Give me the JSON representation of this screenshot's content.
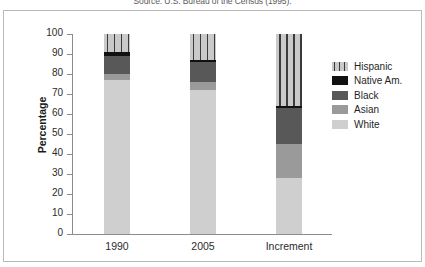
{
  "caption": "Source: U.S. Bureau of the Census (1995).",
  "axes": {
    "ylabel": "Percentage",
    "yticks": [
      "0",
      "10",
      "20",
      "30",
      "40",
      "50",
      "60",
      "70",
      "80",
      "90",
      "100"
    ]
  },
  "legend": {
    "items": [
      {
        "label": "Hispanic",
        "key": "hispanic",
        "color": "#c9c9c9"
      },
      {
        "label": "Native Am.",
        "key": "native",
        "color": "#111111"
      },
      {
        "label": "Black",
        "key": "black",
        "color": "#585858"
      },
      {
        "label": "Asian",
        "key": "asian",
        "color": "#9a9a9a"
      },
      {
        "label": "White",
        "key": "white",
        "color": "#cfcfcf"
      }
    ]
  },
  "chart_data": {
    "type": "bar",
    "subtype": "stacked",
    "title": "",
    "xlabel": "",
    "ylabel": "Percentage",
    "ylim": [
      0,
      100
    ],
    "ytick_step": 10,
    "grid": false,
    "legend_position": "right",
    "categories": [
      "1990",
      "2005",
      "Increment"
    ],
    "series": [
      {
        "name": "White",
        "values": [
          77,
          72,
          28
        ]
      },
      {
        "name": "Asian",
        "values": [
          3,
          4,
          17
        ]
      },
      {
        "name": "Black",
        "values": [
          9,
          10,
          18
        ]
      },
      {
        "name": "Native Am.",
        "values": [
          2,
          1,
          1
        ]
      },
      {
        "name": "Hispanic",
        "values": [
          9,
          13,
          36
        ]
      }
    ],
    "stack_order_bottom_to_top": [
      "White",
      "Asian",
      "Black",
      "Native Am.",
      "Hispanic"
    ]
  }
}
